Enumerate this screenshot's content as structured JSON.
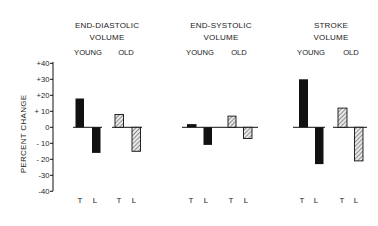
{
  "chart_data": {
    "type": "bar",
    "title": "",
    "ylabel": "PERCENT CHANGE",
    "xlabel": "",
    "ylim": [
      -40,
      40
    ],
    "yticks": [
      40,
      30,
      20,
      10,
      0,
      -10,
      -20,
      -30,
      -40
    ],
    "ytick_labels": [
      "+40",
      "+30",
      "+20",
      "+ 10",
      "0",
      "- 10",
      "- 20",
      "-30",
      "-40"
    ],
    "grid": false,
    "legend": "none (fill encodes group: solid black = YOUNG, hatched = OLD)",
    "categories": [
      "T",
      "L"
    ],
    "panels": [
      {
        "title_lines": [
          "END-DIASTOLIC",
          "VOLUME"
        ],
        "series": [
          {
            "name": "YOUNG",
            "fill": "solid",
            "values": [
              18,
              -16
            ]
          },
          {
            "name": "OLD",
            "fill": "hatched",
            "values": [
              8,
              -15
            ]
          }
        ]
      },
      {
        "title_lines": [
          "END-SYSTOLIC",
          "VOLUME"
        ],
        "series": [
          {
            "name": "YOUNG",
            "fill": "solid",
            "values": [
              2,
              -11
            ]
          },
          {
            "name": "OLD",
            "fill": "hatched",
            "values": [
              7,
              -7
            ]
          }
        ]
      },
      {
        "title_lines": [
          "STROKE",
          "VOLUME"
        ],
        "series": [
          {
            "name": "YOUNG",
            "fill": "solid",
            "values": [
              30,
              -23
            ]
          },
          {
            "name": "OLD",
            "fill": "hatched",
            "values": [
              12,
              -21
            ]
          }
        ]
      }
    ]
  },
  "colors": {
    "ink": "#111111",
    "hatch_bg": "#e8e8e8",
    "hatch_line": "#555555",
    "background": "#ffffff"
  }
}
